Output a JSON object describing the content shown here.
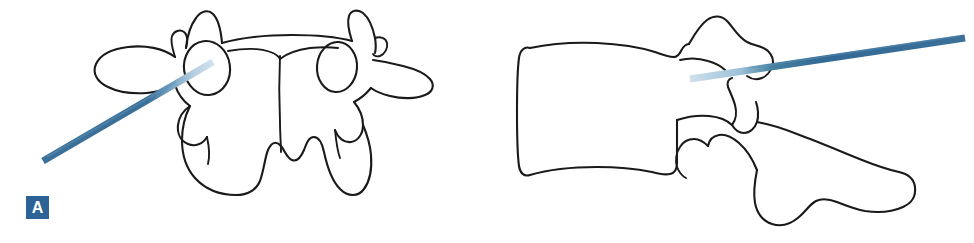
{
  "figure": {
    "width": 974,
    "height": 243,
    "background_color": "#ffffff",
    "type": "medical-line-illustration",
    "panel_count": 2
  },
  "style": {
    "outline_color": "#1a1a1a",
    "outline_width": 2.1,
    "label_background": "#2d6296",
    "label_text_color": "#ffffff",
    "needle_solid_color": "#3b7099",
    "needle_tip_color": "#a8c4da",
    "needle_highlight_color": "#5d90b5"
  },
  "panels": [
    {
      "id": "panel-a",
      "label": "A",
      "view": "axial-anteroposterior",
      "description": "Axial view of vertebra with needle entering left pedicle",
      "needle": {
        "name": "needle-a",
        "entry_point_x": 43,
        "entry_point_y": 161,
        "tip_point_x": 213,
        "tip_point_y": 62,
        "width": 7,
        "orientation": "oblique-down-left",
        "tip_fade_start_x": 178,
        "tip_fade_start_y": 82
      },
      "anatomy": [
        {
          "name": "vertebral-body",
          "label": "vertebral body"
        },
        {
          "name": "left-transverse-process",
          "label": "left transverse process"
        },
        {
          "name": "right-transverse-process",
          "label": "right transverse process"
        },
        {
          "name": "left-pedicle-ring",
          "label": "left pedicle",
          "cx": 207,
          "cy": 68,
          "rx": 23,
          "ry": 27
        },
        {
          "name": "right-pedicle-ring",
          "label": "right pedicle",
          "cx": 337,
          "cy": 67,
          "rx": 20,
          "ry": 25
        },
        {
          "name": "spinous-process",
          "label": "spinous process"
        },
        {
          "name": "left-superior-articular-process",
          "label": "left superior articular process"
        },
        {
          "name": "right-superior-articular-process",
          "label": "right superior articular process"
        }
      ]
    },
    {
      "id": "panel-b",
      "label": "B",
      "view": "lateral",
      "description": "Lateral view of vertebra with needle advancing through pedicle into body",
      "needle": {
        "name": "needle-b",
        "entry_point_x": 965,
        "entry_point_y": 38,
        "tip_point_x": 690,
        "tip_point_y": 79,
        "width": 7,
        "orientation": "near-horizontal",
        "tip_fade_start_x": 748,
        "tip_fade_start_y": 70
      },
      "anatomy": [
        {
          "name": "vertebral-body",
          "label": "vertebral body"
        },
        {
          "name": "pedicle",
          "label": "pedicle"
        },
        {
          "name": "superior-articular-process",
          "label": "superior articular process"
        },
        {
          "name": "inferior-articular-process",
          "label": "inferior articular process"
        },
        {
          "name": "spinous-process",
          "label": "spinous process"
        },
        {
          "name": "transverse-process",
          "label": "transverse process"
        }
      ]
    }
  ]
}
